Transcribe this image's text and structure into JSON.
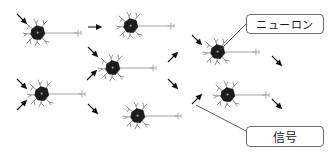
{
  "diagram": {
    "background_color": "#ffffff",
    "width": 330,
    "height": 158,
    "neuron_color": "#1a1a1a",
    "dendrite_color": "#8a8a8a",
    "axon_color": "#9a9a9a",
    "arrow_color": "#141414",
    "leader_line_color": "#4a4a4a",
    "callout_border_color": "#6b6b6b",
    "callouts": [
      {
        "id": "neuron",
        "label": "ニューロン",
        "points_to": "neuron-top-right"
      },
      {
        "id": "signal",
        "label": "信号",
        "points_to": "arrow-signal"
      }
    ],
    "neurons": [
      {
        "id": "neuron-top-left",
        "cx": 38,
        "cy": 33,
        "axon_length": 40
      },
      {
        "id": "neuron-top-center",
        "cx": 131,
        "cy": 26,
        "axon_length": 40
      },
      {
        "id": "neuron-top-right",
        "cx": 218,
        "cy": 52,
        "axon_length": 38
      },
      {
        "id": "neuron-mid-center",
        "cx": 113,
        "cy": 68,
        "axon_length": 40
      },
      {
        "id": "neuron-mid-left",
        "cx": 42,
        "cy": 94,
        "axon_length": 40
      },
      {
        "id": "neuron-mid-right",
        "cx": 228,
        "cy": 95,
        "axon_length": 38
      },
      {
        "id": "neuron-bottom-center",
        "cx": 138,
        "cy": 116,
        "axon_length": 40
      }
    ],
    "signal_arrows": [
      {
        "id": "arrow-1",
        "x": 17,
        "y": 14,
        "angle": 45
      },
      {
        "id": "arrow-2",
        "x": 88,
        "y": 27,
        "angle": 0
      },
      {
        "id": "arrow-3",
        "x": 88,
        "y": 47,
        "angle": 45
      },
      {
        "id": "arrow-4",
        "x": 192,
        "y": 35,
        "angle": 45
      },
      {
        "id": "arrow-5",
        "x": 272,
        "y": 56,
        "angle": 45
      },
      {
        "id": "arrow-6",
        "x": 168,
        "y": 62,
        "angle": -45
      },
      {
        "id": "arrow-7",
        "x": 168,
        "y": 79,
        "angle": 45
      },
      {
        "id": "arrow-8",
        "x": 87,
        "y": 80,
        "angle": -45
      },
      {
        "id": "arrow-9",
        "x": 17,
        "y": 79,
        "angle": 45
      },
      {
        "id": "arrow-10",
        "x": 17,
        "y": 110,
        "angle": -45
      },
      {
        "id": "arrow-11",
        "x": 88,
        "y": 104,
        "angle": 45
      },
      {
        "id": "arrow-12",
        "x": 272,
        "y": 99,
        "angle": 45
      },
      {
        "id": "arrow-signal",
        "x": 192,
        "y": 104,
        "angle": -45
      }
    ]
  }
}
